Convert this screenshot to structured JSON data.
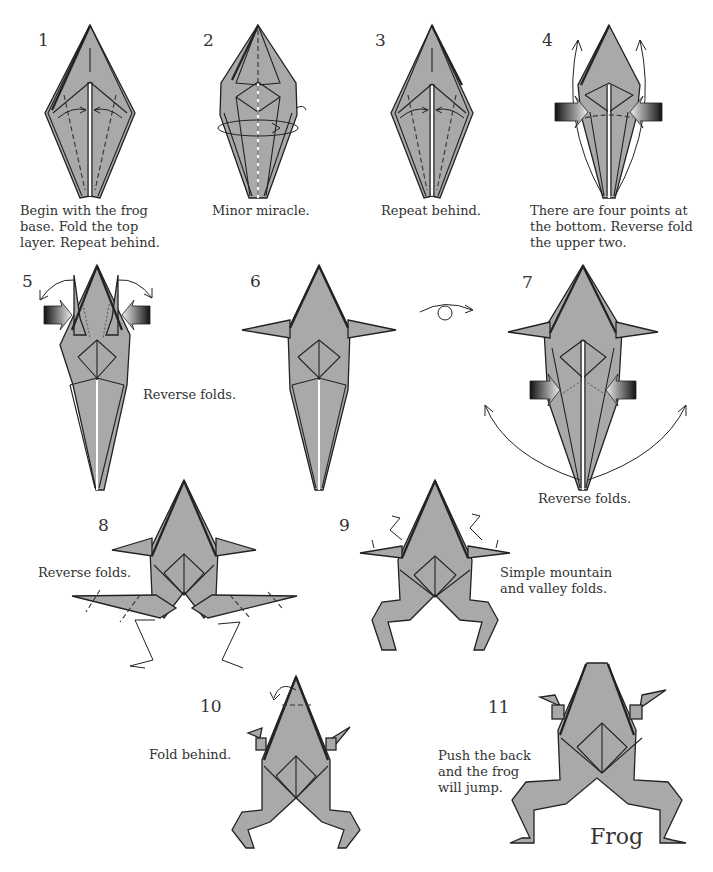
{
  "diagram": {
    "title": "Frog",
    "paper_color": "#a9a9a9",
    "line_color": "#222222",
    "steps": [
      {
        "number": "1",
        "caption": "Begin with the frog\nbase. Fold the top\nlayer. Repeat behind."
      },
      {
        "number": "2",
        "caption": "Minor miracle."
      },
      {
        "number": "3",
        "caption": "Repeat behind."
      },
      {
        "number": "4",
        "caption": "There are four points at\nthe bottom. Reverse fold\nthe upper two."
      },
      {
        "number": "5",
        "caption": "Reverse folds."
      },
      {
        "number": "6",
        "caption": ""
      },
      {
        "number": "7",
        "caption": "Reverse folds."
      },
      {
        "number": "8",
        "caption": "Reverse folds."
      },
      {
        "number": "9",
        "caption": "Simple mountain\nand valley folds."
      },
      {
        "number": "10",
        "caption": "Fold behind."
      },
      {
        "number": "11",
        "caption": "Push the back\nand the frog\nwill jump."
      }
    ],
    "symbols": {
      "turn_over": "turn-over-arrow",
      "reverse_fold": "push-arrow",
      "valley_fold": "dashed-line",
      "mountain_fold": "dot-dash-line"
    }
  }
}
